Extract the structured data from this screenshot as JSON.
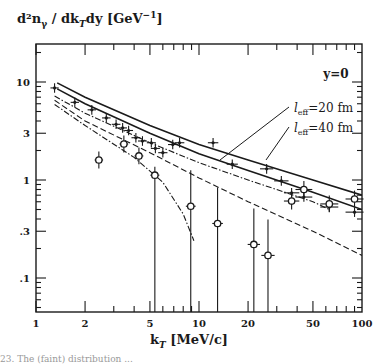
{
  "chart_data": {
    "type": "scatter",
    "title": "",
    "ylabel": "d²n_γ / dk_T dy [GeV⁻¹]",
    "xlabel": "k_T [MeV/c]",
    "xscale": "log",
    "yscale": "log",
    "xlim": [
      1,
      100
    ],
    "ylim": [
      0.046,
      25
    ],
    "grid": false,
    "x_ticks": [
      1,
      2,
      5,
      10,
      20,
      50,
      100
    ],
    "x_tick_labels": [
      "1",
      "2",
      "5",
      "10",
      "20",
      "50",
      "100"
    ],
    "y_ticks": [
      0.1,
      0.3,
      1,
      3,
      10
    ],
    "y_tick_labels": [
      ".1",
      ".3",
      "1",
      "3",
      "10"
    ],
    "annotations": [
      {
        "text": "y=0",
        "position": "top-right"
      },
      {
        "text": "l_eff=20 fm",
        "pointer_to": [
          12.5,
          1.65
        ]
      },
      {
        "text": "l_eff=40 fm",
        "pointer_to": [
          20,
          1.2
        ]
      }
    ],
    "series": [
      {
        "name": "data (crosses)",
        "marker": "cross",
        "x": [
          1.3,
          1.73,
          2.2,
          2.7,
          3.1,
          3.4,
          3.7,
          4.1,
          4.5,
          5.1,
          5.4,
          6.0,
          6.9,
          7.6,
          12.2,
          16,
          26,
          32,
          37,
          44,
          63,
          90
        ],
        "y": [
          8.7,
          6.2,
          5.2,
          4.3,
          3.7,
          3.4,
          3.2,
          2.7,
          2.5,
          2.4,
          2.1,
          1.9,
          2.3,
          2.4,
          2.4,
          1.45,
          1.3,
          0.98,
          0.74,
          0.67,
          0.53,
          0.47
        ]
      },
      {
        "name": "data (open circles)",
        "marker": "circle",
        "x": [
          2.43,
          3.46,
          4.28,
          5.36,
          8.9,
          13.0,
          21.7,
          26.5,
          37,
          44,
          63,
          90
        ],
        "y": [
          1.6,
          2.33,
          1.76,
          1.12,
          0.54,
          0.36,
          0.22,
          0.17,
          0.61,
          0.8,
          0.57,
          0.64
        ]
      },
      {
        "name": "l_eff=20 fm",
        "style": "solid",
        "x": [
          1.35,
          2,
          5,
          10,
          20,
          50,
          100
        ],
        "y": [
          9.8,
          7.0,
          3.6,
          2.3,
          1.6,
          1.0,
          0.7
        ]
      },
      {
        "name": "l_eff=40 fm",
        "style": "solid",
        "x": [
          1.35,
          2,
          5,
          10,
          20,
          50,
          100
        ],
        "y": [
          8.5,
          6.0,
          3.0,
          1.85,
          1.25,
          0.75,
          0.5
        ]
      },
      {
        "name": "dash-dot (upper)",
        "style": "dashdot",
        "x": [
          1.3,
          2,
          5,
          10,
          20,
          50,
          63
        ],
        "y": [
          7.2,
          4.8,
          2.4,
          1.5,
          1.0,
          0.6,
          0.5
        ]
      },
      {
        "name": "dashed",
        "style": "dashed",
        "x": [
          1.3,
          2,
          5,
          10,
          20,
          50,
          100
        ],
        "y": [
          6.5,
          4.0,
          1.9,
          1.05,
          0.6,
          0.3,
          0.17
        ]
      },
      {
        "name": "dash-dot (cutoff)",
        "style": "dashdot",
        "x": [
          1.3,
          2,
          4,
          6,
          8,
          9.3
        ],
        "y": [
          5.9,
          3.6,
          1.7,
          0.95,
          0.45,
          0.24
        ]
      }
    ]
  },
  "labels": {
    "ylabel": "d²n",
    "ylabel_sub": "γ",
    "ylabel_mid": " / dk",
    "ylabel_sub2": "T",
    "ylabel_end": "dy [GeV",
    "ylabel_sup": "−1",
    "ylabel_close": "]",
    "xlabel": "k",
    "xlabel_sub": "T",
    "xlabel_end": " [MeV/c]",
    "caption_fragment": "23.  The (faint) distribution ..."
  }
}
